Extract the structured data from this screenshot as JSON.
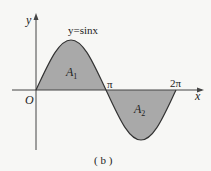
{
  "figure": {
    "caption": "( b )",
    "function_label": "y=sinx",
    "axis_labels": {
      "x": "x",
      "y": "y",
      "origin": "O"
    },
    "ticks": {
      "pi": "π",
      "two_pi": "2π"
    },
    "regions": {
      "a1": {
        "main": "A",
        "sub": "1"
      },
      "a2": {
        "main": "A",
        "sub": "2"
      }
    },
    "colors": {
      "fill": "#a9a9a9",
      "curve": "#333333",
      "axis": "#444444",
      "background": "#f7f7f5"
    }
  }
}
